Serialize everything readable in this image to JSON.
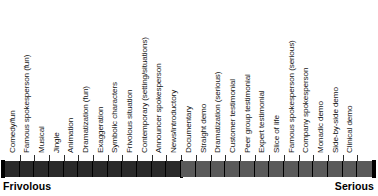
{
  "chart_data": {
    "type": "bar",
    "title": "",
    "subtitle": "",
    "xlabel": "",
    "ylabel": "",
    "orientation": "horizontal",
    "grid": false,
    "legend_position": "none",
    "axis_anchor_left": "Frivolous",
    "axis_anchor_right": "Serious",
    "n_categories": 25,
    "categories": [
      "Comedy/fun",
      "Famous spokesperson (fun)",
      "Musical",
      "Jingle",
      "Animation",
      "Dramatization (fun)",
      "Exaggeration",
      "Symbolic characters",
      "Frivolous situation",
      "Contemporary (setting/situations)",
      "Announcer spokesperson",
      "News/introductory",
      "Documentary",
      "Straight demo",
      "Dramatization (serious)",
      "Customer testimonial",
      "Peer group testimonial",
      "Expert testimonial",
      "Slice of life",
      "Famous spokesperson (serious)",
      "Company spokesperson",
      "Monadic demo",
      "Side-by-side demo",
      "Clinical demo"
    ],
    "values": [
      1,
      2,
      3,
      4,
      5,
      6,
      7,
      8,
      9,
      10,
      11,
      12,
      13,
      14,
      15,
      16,
      17,
      18,
      19,
      20,
      21,
      22,
      23,
      24
    ],
    "xlim": [
      0,
      25
    ],
    "segments": [
      {
        "name": "Frivolous half",
        "cells": 12,
        "color": "#2a2a2a",
        "start_index": 0,
        "end_index": 11
      },
      {
        "name": "Serious half",
        "cells": 13,
        "color": "#5a5a5a",
        "start_index": 12,
        "end_index": 24
      }
    ],
    "annotations": [
      "Bar is divided at the midpoint by a thick black divider between 'News/introductory' and 'Documentary'."
    ]
  },
  "scale": {
    "anchor_left": "Frivolous",
    "anchor_right": "Serious",
    "labels": [
      "Comedy/fun",
      "Famous spokesperson (fun)",
      "Musical",
      "Jingle",
      "Animation",
      "Dramatization (fun)",
      "Exaggeration",
      "Symbolic characters",
      "Frivolous situation",
      "Contemporary (setting/situations)",
      "Announcer spokesperson",
      "News/introductory",
      "Documentary",
      "Straight demo",
      "Dramatization (serious)",
      "Customer testimonial",
      "Peer group testimonial",
      "Expert testimonial",
      "Slice of life",
      "Famous spokesperson (serious)",
      "Company spokesperson",
      "Monadic demo",
      "Side-by-side demo",
      "Clinical demo"
    ],
    "colors": {
      "left_half": "#2a2a2a",
      "right_half": "#5a5a5a",
      "divider": "#000000",
      "tick": "#2b2b2b",
      "text": "#151515",
      "anchor_text": "#000000",
      "background": "#ffffff"
    }
  }
}
